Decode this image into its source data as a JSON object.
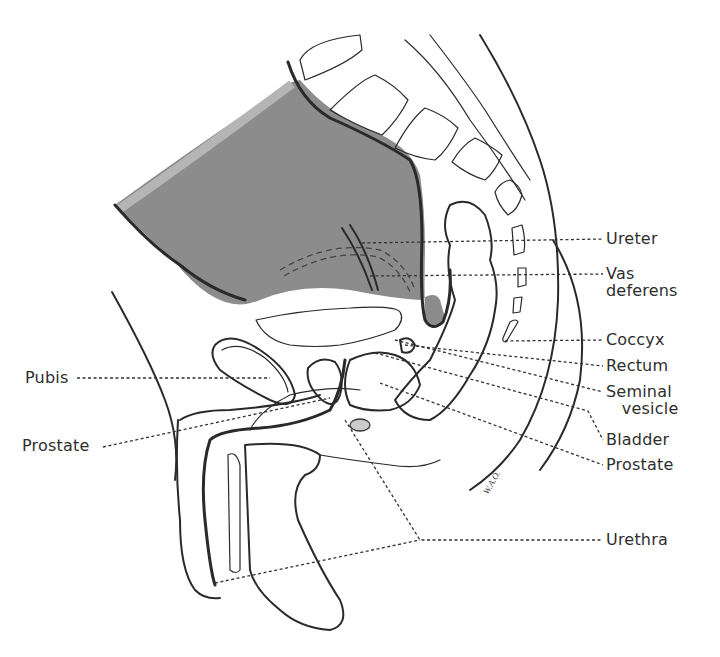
{
  "figure": {
    "type": "anatomical-illustration",
    "view": "midsagittal section of male pelvis",
    "artist_initials": "W.A.O.",
    "colors": {
      "bladder_fill": "#8c8c8c",
      "bladder_highlight": "#b5b5b5",
      "outline": "#2a2a2a",
      "label_text": "#2e2e2e",
      "background": "#ffffff"
    }
  },
  "labels": {
    "right": [
      {
        "id": "ureter",
        "text": "Ureter"
      },
      {
        "id": "vas-deferens",
        "text": "Vas\ndeferens"
      },
      {
        "id": "coccyx",
        "text": "Coccyx"
      },
      {
        "id": "rectum",
        "text": "Rectum"
      },
      {
        "id": "seminal-vesicle",
        "text": "Seminal\n   vesicle"
      },
      {
        "id": "bladder",
        "text": "Bladder"
      },
      {
        "id": "prostate-right",
        "text": "Prostate"
      },
      {
        "id": "urethra",
        "text": "Urethra"
      }
    ],
    "left": [
      {
        "id": "pubis",
        "text": "Pubis"
      },
      {
        "id": "prostate-left",
        "text": "Prostate"
      }
    ]
  }
}
